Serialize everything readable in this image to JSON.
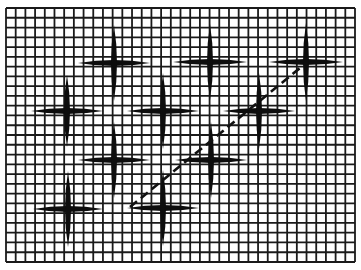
{
  "figure": {
    "width": 361,
    "height": 270,
    "background": "#ffffff",
    "ink": "#111111"
  },
  "grid": {
    "x0": 6,
    "y0": 8,
    "x1": 355,
    "y1": 262,
    "columns": 36,
    "rows": 26,
    "stroke": "#1a1a1a",
    "stroke_width": 1.8
  },
  "crosses": [
    {
      "id": 1,
      "cx": 114,
      "cy": 63,
      "half_w": 36,
      "half_h": 38
    },
    {
      "id": 2,
      "cx": 210,
      "cy": 62,
      "half_w": 37,
      "half_h": 38
    },
    {
      "id": 3,
      "cx": 306,
      "cy": 62,
      "half_w": 37,
      "half_h": 39
    },
    {
      "id": 4,
      "cx": 67,
      "cy": 111,
      "half_w": 36,
      "half_h": 36
    },
    {
      "id": 5,
      "cx": 163,
      "cy": 111,
      "half_w": 36,
      "half_h": 38
    },
    {
      "id": 6,
      "cx": 259,
      "cy": 111,
      "half_w": 36,
      "half_h": 38
    },
    {
      "id": 7,
      "cx": 114,
      "cy": 160,
      "half_w": 36,
      "half_h": 38
    },
    {
      "id": 8,
      "cx": 211,
      "cy": 160,
      "half_w": 36,
      "half_h": 38
    },
    {
      "id": 9,
      "cx": 68,
      "cy": 209,
      "half_w": 35,
      "half_h": 38
    },
    {
      "id": 10,
      "cx": 163,
      "cy": 208,
      "half_w": 36,
      "half_h": 38
    }
  ],
  "cross_style": {
    "stroke": "#0d0d0d",
    "bar_thickness": 6
  },
  "dashed_line": {
    "x1": 130,
    "y1": 207,
    "x2": 300,
    "y2": 68,
    "stroke": "#111111",
    "stroke_width": 2.6,
    "dash": "9 5"
  }
}
